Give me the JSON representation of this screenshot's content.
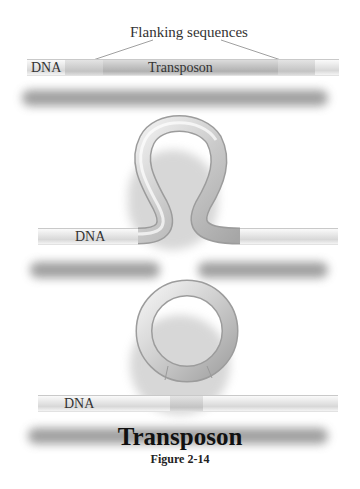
{
  "figure": {
    "title": "Transposon",
    "caption": "Figure 2-14"
  },
  "panel_linear": {
    "header_label": "Flanking sequences",
    "dna_label": "DNA",
    "transposon_label": "Transposon"
  },
  "panel_loop": {
    "dna_label": "DNA"
  },
  "panel_excised": {
    "dna_label": "DNA"
  },
  "colors": {
    "tube_light": "#f4f4f4",
    "tube_mid": "#cfcfcf",
    "tube_dark": "#9e9e9e",
    "transposon_fill": "#bdbdbd",
    "shadow": "#8e8e8e",
    "text": "#222222"
  }
}
